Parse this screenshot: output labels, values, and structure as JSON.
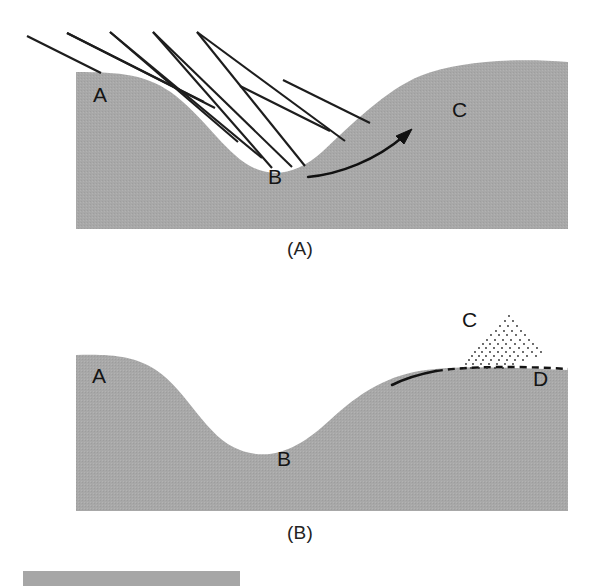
{
  "figure": {
    "background_color": "#ffffff",
    "terrain_fill": "#a8a8a8",
    "line_color": "#1a1a1a",
    "panels": [
      {
        "id": "A",
        "caption": "(A)",
        "description": "Hillslope cross-section with parallel incident lines and a curved transport arrow from the valley bottom up the far slope",
        "labels": [
          {
            "key": "a",
            "text": "A",
            "meaning": "upper hillslope crest on the left"
          },
          {
            "key": "b",
            "text": "B",
            "meaning": "valley bottom / low point"
          },
          {
            "key": "c",
            "text": "C",
            "meaning": "rising slope on the right"
          }
        ],
        "annotations": {
          "incident_lines_count": 5,
          "arrow": {
            "from": "B",
            "to": "C",
            "style": "curved-arrow"
          }
        }
      },
      {
        "id": "B",
        "caption": "(B)",
        "description": "Same hillslope profile later: solid line along the right slope, stippled deposit mound and dashed former surface extending to the right",
        "labels": [
          {
            "key": "a",
            "text": "A",
            "meaning": "upper hillslope crest on the left"
          },
          {
            "key": "b",
            "text": "B",
            "meaning": "valley bottom / low point"
          },
          {
            "key": "c",
            "text": "C",
            "meaning": "stippled deposit mound on the slope"
          },
          {
            "key": "d",
            "text": "D",
            "meaning": "far right surface"
          }
        ],
        "annotations": {
          "solid_line": "dark solid line traced along the upper right slope",
          "dashed_line": "dashed line continuing to the right beneath the deposit",
          "stipple_mound": "dotted triangular deposit above the slope at C"
        }
      }
    ],
    "scale_bar": {
      "present": true,
      "color": "#a6a6a6",
      "label": ""
    }
  }
}
